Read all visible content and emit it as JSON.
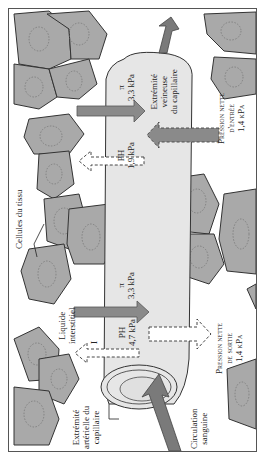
{
  "diagram": {
    "orientation": "rotated -90deg",
    "colors": {
      "cell_fill": "#a9a9a9",
      "cell_stroke": "#333333",
      "nucleus_stroke": "#777777",
      "capillary_fill": "#e6e6e6",
      "arrow_dark": "#8a8a8a",
      "arrow_light": "#ffffff",
      "flow_arrow": "#7a7a7a"
    },
    "labels": {
      "venous_end": [
        "Extrémité",
        "veineuse",
        "du capillaire"
      ],
      "arterial_end": [
        "Extrémité",
        "artérielle du",
        "capillaire"
      ],
      "tissue_cells": "Cellules du tissu",
      "interstitial_fluid": [
        "Liquide",
        "interstitiel"
      ],
      "interstitial_symbol": "I",
      "blood_flow": [
        "Circulation",
        "sanguine"
      ],
      "net_in": {
        "line1": "Pression nette",
        "line2": "d'entrée",
        "value": "1,4 kPa"
      },
      "net_out": {
        "line1": "Pression nette",
        "line2": "de sortie",
        "value": "1,4 kPa"
      }
    },
    "pressures": {
      "venous": {
        "pi_symbol": "π",
        "pi_value": "3,3 kPa",
        "ph_label": "PH",
        "ph_value": "1,9 kPa"
      },
      "arterial": {
        "pi_symbol": "π",
        "pi_value": "3,3 kPa",
        "ph_label": "PH",
        "ph_value": "4,7 kPa"
      }
    }
  }
}
